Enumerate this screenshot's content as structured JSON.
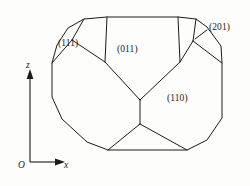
{
  "figure": {
    "kind": "crystal-habit-diagram",
    "background_color": "#fdfdfb",
    "line_color": "#1a1a1a",
    "width": 250,
    "height": 186
  },
  "axes": {
    "origin_label": "O",
    "vertical_label": "z",
    "horizontal_label": "x",
    "vertical_axis": {
      "x": 30,
      "y_bottom": 162,
      "y_top": 72,
      "arrow": "up"
    },
    "horizontal_axis": {
      "y": 162,
      "x_left": 30,
      "x_right": 62,
      "arrow": "right"
    }
  },
  "face_labels": [
    {
      "id": "label-111",
      "text": "(111)",
      "x": 58,
      "y": 38
    },
    {
      "id": "label-011",
      "text": "(011)",
      "x": 117,
      "y": 44
    },
    {
      "id": "label-201",
      "text": "(201)",
      "x": 209,
      "y": 22
    },
    {
      "id": "label-110",
      "text": "(110)",
      "x": 167,
      "y": 93
    }
  ],
  "leader_line": {
    "name": "leader-201",
    "from": [
      208,
      30
    ],
    "to": [
      196,
      38
    ]
  },
  "outline": {
    "name": "crystal-outline",
    "points": [
      [
        84,
        19
      ],
      [
        107,
        17
      ],
      [
        178,
        17
      ],
      [
        196,
        19
      ],
      [
        207,
        27
      ],
      [
        221,
        46
      ],
      [
        222,
        63
      ],
      [
        222,
        118
      ],
      [
        207,
        140
      ],
      [
        187,
        150
      ],
      [
        108,
        150
      ],
      [
        87,
        142
      ],
      [
        62,
        119
      ],
      [
        52,
        97
      ],
      [
        52,
        63
      ],
      [
        57,
        45
      ],
      [
        68,
        28
      ]
    ]
  },
  "internal_edges": [
    {
      "name": "edge-top-left-vertical",
      "points": [
        [
          107,
          17
        ],
        [
          105,
          62
        ]
      ]
    },
    {
      "name": "edge-top-right-vertical",
      "points": [
        [
          178,
          17
        ],
        [
          180,
          62
        ]
      ]
    },
    {
      "name": "edge-111-upper",
      "points": [
        [
          84,
          19
        ],
        [
          72,
          40
        ]
      ]
    },
    {
      "name": "edge-111-lower",
      "points": [
        [
          72,
          40
        ],
        [
          52,
          63
        ]
      ]
    },
    {
      "name": "edge-111-inner",
      "points": [
        [
          72,
          40
        ],
        [
          105,
          62
        ]
      ]
    },
    {
      "name": "edge-201-upper",
      "points": [
        [
          196,
          19
        ],
        [
          193,
          41
        ]
      ]
    },
    {
      "name": "edge-201-lower",
      "points": [
        [
          193,
          41
        ],
        [
          222,
          63
        ]
      ]
    },
    {
      "name": "edge-201-inner",
      "points": [
        [
          193,
          41
        ],
        [
          180,
          62
        ]
      ]
    },
    {
      "name": "edge-011-left-down",
      "points": [
        [
          105,
          62
        ],
        [
          140,
          100
        ]
      ]
    },
    {
      "name": "edge-011-right-down",
      "points": [
        [
          180,
          62
        ],
        [
          140,
          100
        ]
      ]
    },
    {
      "name": "edge-center-vertical",
      "points": [
        [
          140,
          100
        ],
        [
          140,
          124
        ]
      ]
    },
    {
      "name": "edge-bottom-left",
      "points": [
        [
          140,
          124
        ],
        [
          108,
          150
        ]
      ]
    },
    {
      "name": "edge-bottom-right",
      "points": [
        [
          140,
          124
        ],
        [
          187,
          150
        ]
      ]
    },
    {
      "name": "edge-left-lower",
      "points": [
        [
          52,
          97
        ],
        [
          87,
          142
        ]
      ]
    }
  ]
}
